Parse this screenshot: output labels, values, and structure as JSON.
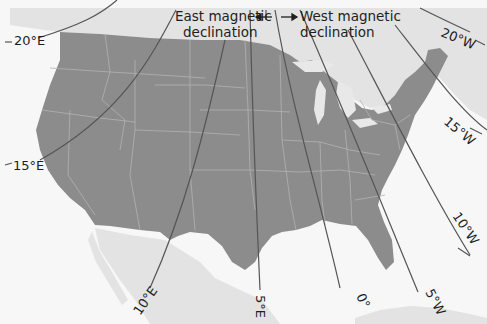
{
  "legend": {
    "east_line1": "East magnetic",
    "east_line2": "declination",
    "west_line1": "West magnetic",
    "west_line2": "declination"
  },
  "isogonic_lines": [
    {
      "id": "20E",
      "label": "20°E"
    },
    {
      "id": "15E",
      "label": "15°E"
    },
    {
      "id": "10E",
      "label": "10°E"
    },
    {
      "id": "5E",
      "label": "5°E"
    },
    {
      "id": "0",
      "label": "0°"
    },
    {
      "id": "5W",
      "label": "5°W"
    },
    {
      "id": "10W",
      "label": "10°W"
    },
    {
      "id": "15W",
      "label": "15°W"
    },
    {
      "id": "20W",
      "label": "20°W"
    }
  ],
  "colors": {
    "land_us": "#8c8c8c",
    "land_other": "#e2e2e2",
    "water": "#f6f6f6",
    "lines": "#555555",
    "borders": "#b3b3b3"
  }
}
